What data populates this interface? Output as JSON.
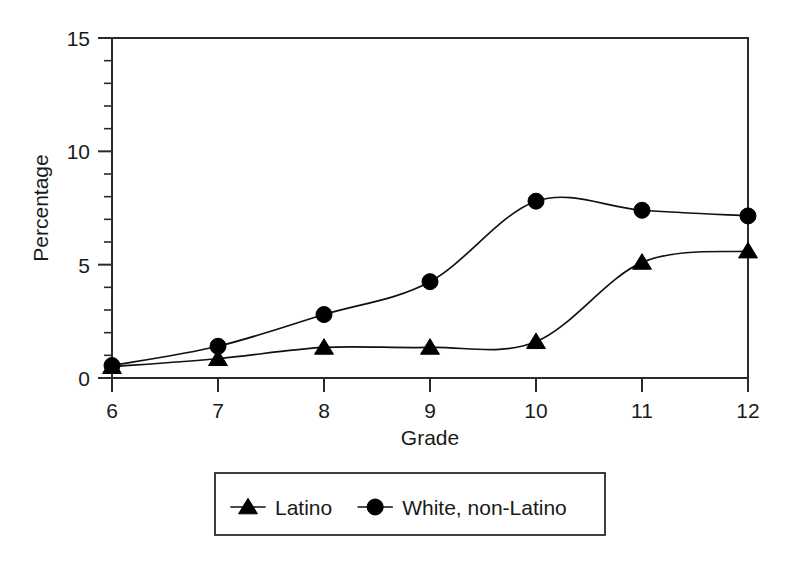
{
  "chart_data": {
    "type": "line",
    "title": "",
    "xlabel": "Grade",
    "ylabel": "Percentage",
    "x": [
      6,
      7,
      8,
      9,
      10,
      11,
      12
    ],
    "xtick_labels": [
      "6",
      "7",
      "8",
      "9",
      "10",
      "11",
      "12"
    ],
    "ytick_labels": [
      "0",
      "5",
      "10",
      "15"
    ],
    "yticks": [
      0,
      5,
      10,
      15
    ],
    "ylim": [
      0,
      15
    ],
    "xlim": [
      6,
      12
    ],
    "y_minor_tick_step": 1,
    "grid": false,
    "legend_position": "below-center",
    "series": [
      {
        "name": "Latino",
        "marker": "triangle",
        "color": "#000000",
        "values": [
          0.5,
          0.85,
          1.35,
          1.35,
          1.6,
          5.1,
          5.6
        ]
      },
      {
        "name": "White, non-Latino",
        "marker": "circle",
        "color": "#000000",
        "values": [
          0.55,
          1.4,
          2.8,
          4.25,
          7.8,
          7.4,
          7.15
        ]
      }
    ]
  },
  "legend": {
    "entries": [
      {
        "label": "Latino",
        "marker": "triangle"
      },
      {
        "label": "White, non-Latino",
        "marker": "circle"
      }
    ]
  },
  "axes": {
    "x_title": "Grade",
    "y_title": "Percentage"
  }
}
